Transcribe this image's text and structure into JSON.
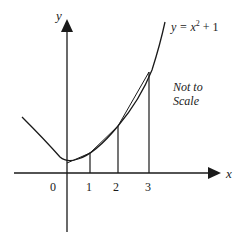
{
  "diagram": {
    "curve_label_prefix": "y = x",
    "curve_label_exp": "2",
    "curve_label_suffix": " + 1",
    "axes": {
      "x_label": "x",
      "y_label": "y"
    },
    "ticks": [
      {
        "label": "0"
      },
      {
        "label": "1"
      },
      {
        "label": "2"
      },
      {
        "label": "3"
      }
    ],
    "note_line1": "Not to",
    "note_line2": "Scale",
    "colors": {
      "stroke": "#1a1a1a",
      "background": "#ffffff"
    }
  }
}
